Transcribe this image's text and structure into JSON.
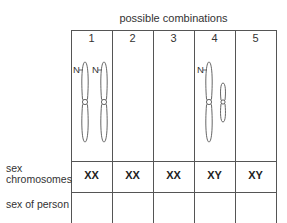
{
  "title": "possible combinations",
  "columns": [
    {
      "number": "1",
      "sex_chromosomes": "XX",
      "sex_of_person": ""
    },
    {
      "number": "2",
      "sex_chromosomes": "XX",
      "sex_of_person": ""
    },
    {
      "number": "3",
      "sex_chromosomes": "XX",
      "sex_of_person": ""
    },
    {
      "number": "4",
      "sex_chromosomes": "XY",
      "sex_of_person": ""
    },
    {
      "number": "5",
      "sex_chromosomes": "XY",
      "sex_of_person": ""
    }
  ],
  "row_labels": {
    "sex_chromosomes_line1": "sex",
    "sex_chromosomes_line2": "chromosomes",
    "sex_of_person": "sex of person"
  },
  "chromosome_label": "N"
}
